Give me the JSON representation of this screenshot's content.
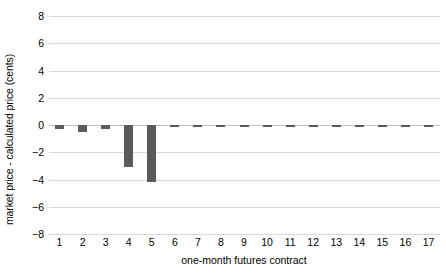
{
  "chart_data": {
    "type": "bar",
    "title": "",
    "xlabel": "one-month futures contract",
    "ylabel": "market price - calculated price (cents)",
    "categories": [
      "1",
      "2",
      "3",
      "4",
      "5",
      "6",
      "7",
      "8",
      "9",
      "10",
      "11",
      "12",
      "13",
      "14",
      "15",
      "16",
      "17"
    ],
    "values": [
      -0.3,
      -0.55,
      -0.3,
      -3.05,
      -4.2,
      -0.1,
      -0.1,
      -0.1,
      -0.1,
      -0.1,
      -0.1,
      -0.1,
      -0.1,
      -0.1,
      -0.1,
      -0.1,
      -0.1
    ],
    "ylim": [
      -8,
      8
    ],
    "yticks": [
      8,
      6,
      4,
      2,
      0,
      -2,
      -4,
      -6,
      -8
    ],
    "ytick_labels": [
      "8",
      "6",
      "4",
      "2",
      "0",
      "−2",
      "−4",
      "−6",
      "−8"
    ],
    "grid": true,
    "grid_axis": "y",
    "legend": false,
    "bar_color": "#5b5b5b",
    "grid_color": "#d9d9d9",
    "background": "#ffffff"
  }
}
